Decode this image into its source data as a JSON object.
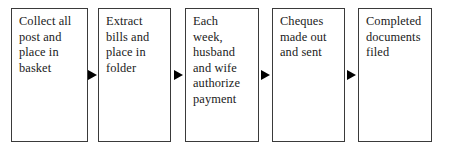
{
  "diagram": {
    "orientation": "left-to-right",
    "background_color": "#ffffff",
    "box_border_color": "#3a3a3a",
    "text_color": "#1a1a1a",
    "arrow_color": "#000000",
    "nodes": [
      {
        "id": "node-1",
        "label": "Collect all\npost and\nplace in\nbasket",
        "x": 11,
        "y": 8,
        "width": 77,
        "height": 134
      },
      {
        "id": "node-2",
        "label": "Extract\nbills and\nplace in\nfolder",
        "x": 98,
        "y": 8,
        "width": 73,
        "height": 134
      },
      {
        "id": "node-3",
        "label": "Each\nweek,\nhusband\nand wife\nauthorize\npayment",
        "x": 185,
        "y": 8,
        "width": 74,
        "height": 134
      },
      {
        "id": "node-4",
        "label": "Cheques\nmade out\nand sent",
        "x": 272,
        "y": 8,
        "width": 73,
        "height": 134
      },
      {
        "id": "node-5",
        "label": "Completed\ndocuments\nfiled",
        "x": 358,
        "y": 8,
        "width": 74,
        "height": 134
      }
    ],
    "connectors": [
      {
        "id": "arrow-1",
        "from": "node-1",
        "to": "node-2",
        "x": 88,
        "y": 70,
        "shape": "solid-triangle-right"
      },
      {
        "id": "arrow-2",
        "from": "node-2",
        "to": "node-3",
        "x": 174,
        "y": 70,
        "shape": "solid-triangle-right"
      },
      {
        "id": "arrow-3",
        "from": "node-3",
        "to": "node-4",
        "x": 261,
        "y": 70,
        "shape": "solid-triangle-right"
      },
      {
        "id": "arrow-4",
        "from": "node-4",
        "to": "node-5",
        "x": 347,
        "y": 70,
        "shape": "solid-triangle-right"
      }
    ]
  }
}
